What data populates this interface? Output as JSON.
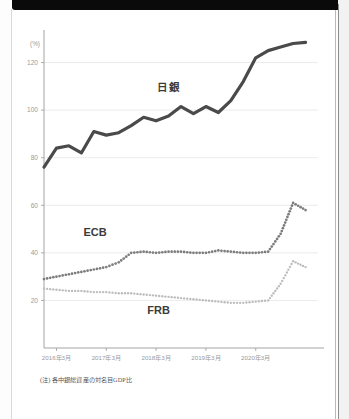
{
  "figure": {
    "note": "(注) 各中銀総資産の対名目GDP比",
    "unit_label": "(%)"
  },
  "chart_data": {
    "type": "line",
    "title": "",
    "subtitle": "",
    "xlabel": "",
    "ylabel": "(%)",
    "ylim": [
      0,
      132
    ],
    "xlim": [
      0,
      22
    ],
    "grid": true,
    "grid_axis": "y",
    "legend": "inline-annotations",
    "yticks": [
      20,
      40,
      60,
      80,
      100,
      120
    ],
    "ytick_labels": [
      "20",
      "40",
      "60",
      "80",
      "100",
      "120"
    ],
    "xticks": [
      1,
      5,
      9,
      13,
      17
    ],
    "xtick_labels": [
      "2016年3月",
      "2017年3月",
      "2018年3月",
      "2019年3月",
      "2020年3月"
    ],
    "x": [
      0,
      1,
      2,
      3,
      4,
      5,
      6,
      7,
      8,
      9,
      10,
      11,
      12,
      13,
      14,
      15,
      16,
      17,
      18,
      19,
      20,
      21
    ],
    "series": [
      {
        "name": "日銀",
        "label": "日銀",
        "color": "#4a4a4a",
        "style": "solid",
        "linewidth": 3.2,
        "values": [
          76,
          84,
          85,
          82,
          91,
          89.5,
          90.5,
          93.5,
          97,
          95.5,
          97.5,
          101.5,
          98.5,
          101.5,
          99,
          104,
          112,
          122,
          125,
          126.5,
          128,
          128.5
        ]
      },
      {
        "name": "ECB",
        "label": "ECB",
        "color": "#7d7d7d",
        "style": "dotted",
        "linewidth": 2.8,
        "values": [
          29,
          30,
          31,
          32,
          33,
          34,
          36,
          40,
          40.5,
          40,
          40.5,
          40.5,
          40,
          40,
          41,
          40.5,
          40,
          40,
          40.5,
          48,
          61,
          58
        ]
      },
      {
        "name": "FRB",
        "label": "FRB",
        "color": "#bcbcbc",
        "style": "dotted",
        "linewidth": 2.4,
        "values": [
          25,
          24.5,
          24,
          24,
          23.5,
          23.5,
          23,
          23,
          22.5,
          22,
          21.5,
          21,
          20.5,
          20,
          19.5,
          19,
          19,
          19.5,
          20,
          27,
          36.5,
          34
        ]
      }
    ],
    "annotations": [
      {
        "text": "日銀",
        "x": 10.0,
        "y": 108,
        "series": "日銀"
      },
      {
        "text": "ECB",
        "x": 4.1,
        "y": 47,
        "series": "ECB"
      },
      {
        "text": "FRB",
        "x": 9.2,
        "y": 14.5,
        "series": "FRB"
      }
    ]
  }
}
